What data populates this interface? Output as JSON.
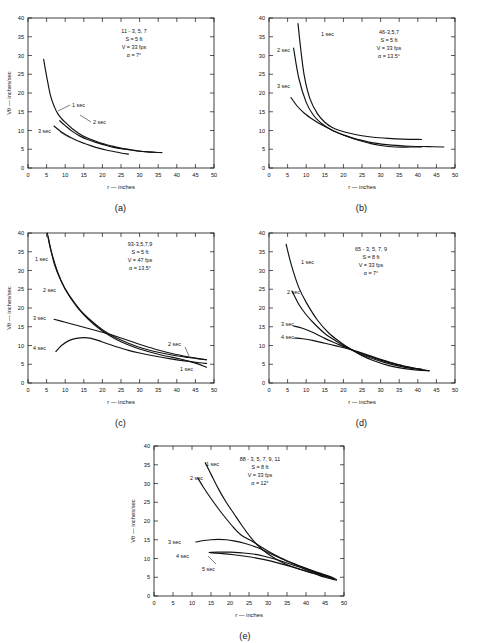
{
  "figure": {
    "axis": {
      "xlabel": "r — inches",
      "ylabel": "Vθ — inches/sec",
      "xticks": [
        0,
        5,
        10,
        15,
        20,
        25,
        30,
        35,
        40,
        45,
        50
      ],
      "yticks": [
        0,
        5,
        10,
        15,
        20,
        25,
        30,
        35,
        40
      ],
      "xlim": [
        0,
        50
      ],
      "ylim": [
        0,
        40
      ]
    },
    "panels": [
      {
        "id": "a",
        "caption": "(a)",
        "annotation": [
          "11 - 3, 5, 7",
          "S  =  5 ft",
          "V  =  33 fps",
          "α  =  7°"
        ],
        "curve_labels": [
          "1 sec",
          "2 sec",
          "3 sec"
        ]
      },
      {
        "id": "b",
        "caption": "(b)",
        "annotation": [
          "46-3,5,7",
          "S  =  5 ft",
          "V  =  33  fps",
          "α  =  13.5°"
        ],
        "curve_labels": [
          "1 sec",
          "2 sec",
          "3 sec"
        ]
      },
      {
        "id": "c",
        "caption": "(c)",
        "annotation": [
          "93-3,5,7,9",
          "S  =  5 ft",
          "V  =  47 fps",
          "α  =  13.5°"
        ],
        "curve_labels": [
          "1 sec",
          "2 sec",
          "3 sec",
          "4 sec",
          "2 sec",
          "1 sec"
        ]
      },
      {
        "id": "d",
        "caption": "(d)",
        "annotation": [
          "65 - 3, 5, 7, 9",
          "S  =  8 ft",
          "V  =  33 fps",
          "α  =  7°"
        ],
        "curve_labels": [
          "1 sec",
          "2 sec",
          "3 sec",
          "4 sec"
        ]
      },
      {
        "id": "e",
        "caption": "(e)",
        "annotation": [
          "88 - 3, 5, 7, 9, 11",
          "S  =  8 ft",
          "V  =  33 fps",
          "α  =  12°"
        ],
        "curve_labels": [
          "1 sec",
          "2 sec",
          "3 sec",
          "4 sec",
          "5 sec"
        ]
      }
    ]
  },
  "chart_data": [
    {
      "type": "line",
      "panel": "a",
      "title": "11 - 3, 5, 7",
      "xlabel": "r — inches",
      "ylabel": "Vθ — inches/sec",
      "xlim": [
        0,
        50
      ],
      "ylim": [
        0,
        40
      ],
      "grid": false,
      "legend_position": "inline-curve-labels",
      "annotations": {
        "run": "11 - 3, 5, 7",
        "S": "5 ft",
        "V": "33 fps",
        "alpha": "7°"
      },
      "series": [
        {
          "name": "1 sec",
          "x": [
            4.2,
            5,
            6,
            7,
            8,
            9,
            10,
            12,
            14,
            16,
            18,
            20,
            22,
            25,
            28,
            31,
            34,
            36
          ],
          "y": [
            29,
            24.5,
            19.5,
            16.5,
            14.5,
            13.2,
            12.2,
            10.4,
            9.0,
            8.0,
            7.2,
            6.5,
            6.0,
            5.3,
            4.8,
            4.4,
            4.2,
            4.1
          ]
        },
        {
          "name": "2 sec",
          "x": [
            8.5,
            10,
            12,
            14,
            16,
            18,
            20,
            23,
            26,
            29,
            32,
            34.5
          ],
          "y": [
            12.6,
            11.3,
            9.7,
            8.5,
            7.6,
            6.9,
            6.3,
            5.5,
            5.0,
            4.6,
            4.3,
            4.2
          ]
        },
        {
          "name": "3 sec",
          "x": [
            7,
            9,
            11,
            13,
            15,
            17,
            19,
            21,
            23,
            25,
            27
          ],
          "y": [
            11.2,
            9.6,
            8.4,
            7.4,
            6.6,
            5.9,
            5.3,
            4.8,
            4.4,
            4.0,
            3.7
          ]
        }
      ]
    },
    {
      "type": "line",
      "panel": "b",
      "title": "46-3,5,7",
      "xlabel": "r — inches",
      "ylabel": "Vθ — inches/sec",
      "xlim": [
        0,
        50
      ],
      "ylim": [
        0,
        40
      ],
      "grid": false,
      "legend_position": "inline-curve-labels",
      "annotations": {
        "run": "46-3,5,7",
        "S": "5 ft",
        "V": "33 fps",
        "alpha": "13.5°"
      },
      "series": [
        {
          "name": "1 sec",
          "x": [
            7.8,
            8.5,
            9.5,
            11,
            13,
            15,
            17,
            19,
            22,
            25,
            28,
            32,
            36,
            41
          ],
          "y": [
            38.5,
            32,
            24.5,
            18.5,
            14.5,
            12.2,
            10.8,
            10.0,
            9.2,
            8.6,
            8.2,
            7.9,
            7.7,
            7.6
          ]
        },
        {
          "name": "2 sec",
          "x": [
            6.6,
            8,
            10,
            12,
            14,
            16,
            18,
            21,
            24,
            28,
            33,
            38,
            43,
            47
          ],
          "y": [
            32,
            24,
            17.5,
            14.0,
            12.0,
            10.6,
            9.6,
            8.5,
            7.6,
            6.7,
            6.1,
            5.8,
            5.7,
            5.6
          ]
        },
        {
          "name": "3 sec",
          "x": [
            5.9,
            7.5,
            9.5,
            12,
            14,
            16,
            18,
            21,
            24,
            27,
            30,
            34,
            38,
            41
          ],
          "y": [
            18.8,
            16.6,
            14.6,
            12.8,
            11.6,
            10.6,
            9.6,
            8.4,
            7.4,
            6.6,
            6.0,
            5.6,
            5.6,
            5.6
          ]
        }
      ]
    },
    {
      "type": "line",
      "panel": "c",
      "title": "93-3,5,7,9",
      "xlabel": "r — inches",
      "ylabel": "Vθ — inches/sec",
      "xlim": [
        0,
        50
      ],
      "ylim": [
        0,
        40
      ],
      "grid": false,
      "legend_position": "inline-curve-labels",
      "annotations": {
        "run": "93-3,5,7,9",
        "S": "5 ft",
        "V": "47 fps",
        "alpha": "13.5°"
      },
      "series": [
        {
          "name": "1 sec",
          "x": [
            5.2,
            6,
            8,
            10,
            13,
            16,
            19,
            22,
            25,
            29,
            33,
            37,
            41,
            45,
            48
          ],
          "y": [
            40,
            36,
            29.5,
            25,
            20.5,
            17.2,
            14.6,
            12.6,
            11.0,
            9.4,
            8.2,
            7.2,
            6.4,
            5.3,
            4.2
          ]
        },
        {
          "name": "2 sec",
          "x": [
            5.4,
            7,
            9,
            11,
            14,
            17,
            20,
            23,
            27,
            31,
            35,
            39,
            43,
            46,
            48
          ],
          "y": [
            39,
            32,
            27,
            23.5,
            19.5,
            16.6,
            14.2,
            12.4,
            10.6,
            9.2,
            8.2,
            7.4,
            6.8,
            6.4,
            6.2
          ]
        },
        {
          "name": "3 sec",
          "x": [
            7,
            10,
            13,
            16,
            19,
            22,
            25,
            28,
            31,
            35,
            39,
            43,
            46,
            48
          ],
          "y": [
            17.0,
            16.2,
            15.4,
            14.6,
            13.8,
            13.0,
            12.0,
            11.0,
            10.0,
            8.8,
            7.8,
            7.0,
            6.5,
            6.2
          ]
        },
        {
          "name": "4 sec",
          "x": [
            7.5,
            9,
            11,
            13,
            15,
            17,
            19,
            21,
            24,
            27,
            30,
            34,
            38,
            42,
            46,
            48
          ],
          "y": [
            8.4,
            10.0,
            11.3,
            11.9,
            12.1,
            11.9,
            11.3,
            10.6,
            9.6,
            8.7,
            8.0,
            7.2,
            6.5,
            5.9,
            5.4,
            5.2
          ]
        }
      ]
    },
    {
      "type": "line",
      "panel": "d",
      "title": "65 - 3, 5, 7, 9",
      "xlabel": "r — inches",
      "ylabel": "Vθ — inches/sec",
      "xlim": [
        0,
        50
      ],
      "ylim": [
        0,
        40
      ],
      "grid": false,
      "legend_position": "inline-curve-labels",
      "annotations": {
        "run": "65 - 3, 5, 7, 9",
        "S": "8 ft",
        "V": "33 fps",
        "alpha": "7°"
      },
      "series": [
        {
          "name": "1 sec",
          "x": [
            4.6,
            6,
            8,
            10,
            13,
            16,
            19,
            22,
            25,
            28,
            32,
            36,
            40,
            43
          ],
          "y": [
            37,
            31.5,
            25.5,
            21.5,
            16.8,
            13.4,
            11.0,
            9.0,
            7.3,
            6.0,
            4.7,
            3.9,
            3.4,
            3.3
          ]
        },
        {
          "name": "2 sec",
          "x": [
            6.2,
            8,
            10,
            12,
            15,
            18,
            21,
            24,
            27,
            31,
            35,
            39,
            42,
            43
          ],
          "y": [
            24.5,
            21.0,
            18.2,
            16.0,
            13.2,
            11.2,
            9.5,
            8.0,
            6.8,
            5.5,
            4.5,
            3.8,
            3.4,
            3.3
          ]
        },
        {
          "name": "3 sec",
          "x": [
            6.6,
            9,
            12,
            15,
            18,
            21,
            24,
            27,
            30,
            34,
            38,
            41,
            43
          ],
          "y": [
            15.2,
            14.6,
            13.4,
            11.9,
            10.6,
            9.3,
            8.2,
            7.1,
            6.1,
            5.0,
            4.1,
            3.5,
            3.3
          ]
        },
        {
          "name": "4 sec",
          "x": [
            6.8,
            9,
            12,
            15,
            18,
            21,
            24,
            27,
            30,
            33,
            36,
            39,
            41
          ],
          "y": [
            12.0,
            11.8,
            11.3,
            10.6,
            9.9,
            9.2,
            8.3,
            7.3,
            6.3,
            5.4,
            4.6,
            4.0,
            3.7
          ]
        }
      ]
    },
    {
      "type": "line",
      "panel": "e",
      "title": "88 - 3, 5, 7, 9, 11",
      "xlabel": "r — inches",
      "ylabel": "Vθ — inches/sec",
      "xlim": [
        0,
        50
      ],
      "ylim": [
        0,
        40
      ],
      "grid": false,
      "legend_position": "inline-curve-labels",
      "annotations": {
        "run": "88 - 3, 5, 7, 9, 11",
        "S": "8 ft",
        "V": "33 fps",
        "alpha": "12°"
      },
      "series": [
        {
          "name": "1 sec",
          "x": [
            13.5,
            15,
            17,
            19,
            21,
            23,
            25,
            27,
            30,
            34,
            38,
            42,
            45,
            48
          ],
          "y": [
            35.5,
            32.5,
            28.5,
            25.0,
            22.0,
            19.0,
            16.2,
            13.8,
            11.2,
            8.8,
            7.2,
            6.0,
            5.0,
            4.2
          ]
        },
        {
          "name": "2 sec",
          "x": [
            11.5,
            13,
            15,
            17,
            19,
            21,
            23,
            25.5,
            28,
            31,
            35,
            39,
            43,
            46,
            48
          ],
          "y": [
            31.5,
            29.0,
            26.0,
            23.2,
            20.6,
            18.2,
            16.2,
            14.8,
            13.2,
            11.4,
            9.4,
            7.8,
            6.3,
            5.3,
            4.4
          ]
        },
        {
          "name": "3 sec",
          "x": [
            11,
            13,
            15,
            17,
            19,
            21,
            24,
            27,
            30,
            33,
            37,
            41,
            44,
            47
          ],
          "y": [
            14.4,
            14.8,
            15.0,
            15.1,
            15.0,
            14.7,
            14.0,
            13.0,
            11.6,
            10.2,
            8.4,
            6.9,
            5.8,
            4.8
          ]
        },
        {
          "name": "4 sec",
          "x": [
            14.5,
            17,
            20,
            23,
            26,
            29,
            32,
            35,
            38,
            41,
            44,
            47
          ],
          "y": [
            11.6,
            11.7,
            11.7,
            11.5,
            11.2,
            10.6,
            9.8,
            8.8,
            7.8,
            6.7,
            5.7,
            4.7
          ]
        },
        {
          "name": "5 sec",
          "x": [
            15,
            18,
            21,
            24,
            27,
            30,
            33,
            36,
            39,
            42,
            45,
            47.5
          ],
          "y": [
            11.5,
            11.3,
            11.0,
            10.6,
            10.1,
            9.5,
            8.7,
            7.9,
            7.0,
            6.1,
            5.2,
            4.5
          ]
        }
      ]
    }
  ]
}
